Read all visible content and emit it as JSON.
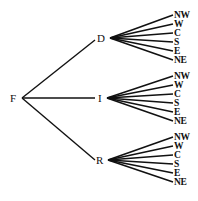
{
  "diagram": {
    "type": "tree",
    "root": {
      "label": "F"
    },
    "branches": [
      {
        "label": "D",
        "leaves": [
          "NW",
          "W",
          "C",
          "S",
          "E",
          "NE"
        ]
      },
      {
        "label": "I",
        "leaves": [
          "NW",
          "W",
          "C",
          "S",
          "E",
          "NE"
        ]
      },
      {
        "label": "R",
        "leaves": [
          "NW",
          "W",
          "C",
          "S",
          "E",
          "NE"
        ]
      }
    ],
    "line_color": "#111111"
  }
}
